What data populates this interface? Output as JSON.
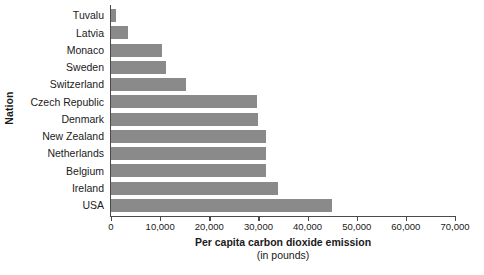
{
  "chart_data": {
    "type": "bar",
    "orientation": "horizontal",
    "title": "",
    "xlabel": "Per capita carbon dioxide emission",
    "xlabel_sub": "(in pounds)",
    "ylabel": "Nation",
    "categories": [
      "Tuvalu",
      "Latvia",
      "Monaco",
      "Sweden",
      "Switzerland",
      "Czech Republic",
      "Denmark",
      "New Zealand",
      "Netherlands",
      "Belgium",
      "Ireland",
      "USA"
    ],
    "values": [
      1000,
      3500,
      10400,
      11200,
      15200,
      29800,
      30000,
      31500,
      31500,
      31500,
      34000,
      45000
    ],
    "xlim": [
      0,
      70000
    ],
    "xticks": [
      0,
      10000,
      20000,
      30000,
      40000,
      50000,
      60000,
      70000
    ],
    "xtick_labels": [
      "0",
      "10,000",
      "20,000",
      "30,000",
      "40,000",
      "50,000",
      "60,000",
      "70,000"
    ],
    "grid": false,
    "legend": false,
    "bar_color": "#8a8a8a",
    "axis_color": "#4a4a4a",
    "background_color": "#ffffff"
  }
}
